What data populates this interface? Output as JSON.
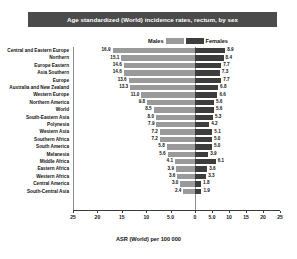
{
  "banner": {
    "title": "Age standardized (World) incidence rates, rectum, by sex"
  },
  "legend": {
    "males_label": "Males",
    "females_label": "Females"
  },
  "axis": {
    "xtitle": "ASR (World) per 100 000"
  },
  "colors": {
    "male": "#9a9a9a",
    "female": "#3d3d3d",
    "banner": "#4b4b4b"
  },
  "chart_data": {
    "type": "bar",
    "orientation": "horizontal",
    "subtype": "population-pyramid",
    "title": "Age standardized (World) incidence rates, rectum, by sex",
    "xlabel": "ASR (World) per 100 000",
    "ylabel": "",
    "grid": false,
    "legend_position": "top-center",
    "xlim_left": [
      0,
      25
    ],
    "xlim_right": [
      0,
      25
    ],
    "left_ticks": [
      "25",
      "20",
      "15",
      "10",
      "5.0",
      "0"
    ],
    "right_ticks": [
      "0",
      "5.0",
      "10",
      "15",
      "20",
      "25"
    ],
    "categories": [
      "Central and Eastern Europe",
      "Northern",
      "Europe Eastern",
      "Asia Southern",
      "Europe",
      "Australia and New Zealand",
      "Western Europe",
      "Northern America",
      "World",
      "South-Eastern Asia",
      "Polynesia",
      "Western Asia",
      "Southern Africa",
      "South America",
      "Melanesia",
      "Middle Africa",
      "Eastern Africa",
      "Western Africa",
      "Central America",
      "South-Central Asia"
    ],
    "series": [
      {
        "name": "Males",
        "values": [
          16.9,
          15.1,
          14.6,
          14.6,
          13.6,
          13.3,
          11.0,
          9.8,
          8.5,
          8.0,
          7.9,
          7.2,
          7.2,
          5.8,
          5.6,
          4.1,
          3.9,
          3.6,
          3.0,
          2.4
        ]
      },
      {
        "name": "Females",
        "values": [
          8.9,
          8.4,
          7.7,
          7.3,
          7.7,
          6.8,
          6.6,
          5.6,
          5.6,
          5.3,
          4.2,
          5.1,
          5.0,
          5.0,
          3.9,
          6.1,
          3.6,
          3.3,
          1.8,
          1.9
        ]
      }
    ]
  }
}
